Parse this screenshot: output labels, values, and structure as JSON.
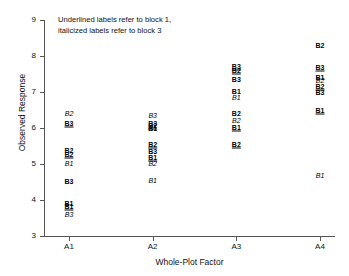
{
  "chart_data": {
    "type": "scatter",
    "title": "",
    "xlabel": "Whole-Plot Factor",
    "ylabel": "Observed Response",
    "annotation_line1": "Underlined labels refer to block 1,",
    "annotation_line2": "italicized labels refer to block 3",
    "grid": false,
    "legend": "none",
    "ylim": [
      3,
      9
    ],
    "yticks": [
      3,
      4,
      5,
      6,
      7,
      8,
      9
    ],
    "ytick_labels": [
      "3",
      "4",
      "5",
      "6",
      "7",
      "8",
      "9"
    ],
    "categories": [
      "A1",
      "A2",
      "A3",
      "A4"
    ],
    "xtick_labels": [
      "A1",
      "A2",
      "A3",
      "A4"
    ],
    "blocks": {
      "block1": "underlined",
      "block2": "bold",
      "block3": "italic"
    },
    "points": [
      {
        "x": "A1",
        "y": 6.42,
        "label": "B2",
        "block": 3
      },
      {
        "x": "A1",
        "y": 6.15,
        "label": "B3",
        "block": 1
      },
      {
        "x": "A1",
        "y": 5.38,
        "label": "B2",
        "block": 2
      },
      {
        "x": "A1",
        "y": 5.27,
        "label": "B2",
        "block": 1
      },
      {
        "x": "A1",
        "y": 5.02,
        "label": "B1",
        "block": 3
      },
      {
        "x": "A1",
        "y": 4.52,
        "label": "B3",
        "block": 2
      },
      {
        "x": "A1",
        "y": 3.93,
        "label": "B1",
        "block": 2
      },
      {
        "x": "A1",
        "y": 3.83,
        "label": "B1",
        "block": 1
      },
      {
        "x": "A1",
        "y": 3.6,
        "label": "B3",
        "block": 3
      },
      {
        "x": "A2",
        "y": 6.36,
        "label": "B3",
        "block": 3
      },
      {
        "x": "A2",
        "y": 6.14,
        "label": "B3",
        "block": 2
      },
      {
        "x": "A2",
        "y": 6.08,
        "label": "B2",
        "block": 1
      },
      {
        "x": "A2",
        "y": 5.99,
        "label": "B1",
        "block": 2
      },
      {
        "x": "A2",
        "y": 5.56,
        "label": "B2",
        "block": 1
      },
      {
        "x": "A2",
        "y": 5.36,
        "label": "B3",
        "block": 2
      },
      {
        "x": "A2",
        "y": 5.19,
        "label": "B1",
        "block": 1
      },
      {
        "x": "A2",
        "y": 5.04,
        "label": "B2",
        "block": 3
      },
      {
        "x": "A2",
        "y": 4.56,
        "label": "B1",
        "block": 3
      },
      {
        "x": "A3",
        "y": 7.71,
        "label": "B3",
        "block": 1
      },
      {
        "x": "A3",
        "y": 7.6,
        "label": "B2",
        "block": 1
      },
      {
        "x": "A3",
        "y": 7.36,
        "label": "B3",
        "block": 2
      },
      {
        "x": "A3",
        "y": 7.02,
        "label": "B1",
        "block": 2
      },
      {
        "x": "A3",
        "y": 6.85,
        "label": "B1",
        "block": 3
      },
      {
        "x": "A3",
        "y": 6.42,
        "label": "B2",
        "block": 2
      },
      {
        "x": "A3",
        "y": 6.21,
        "label": "B2",
        "block": 3
      },
      {
        "x": "A3",
        "y": 6.02,
        "label": "B1",
        "block": 1
      },
      {
        "x": "A3",
        "y": 5.56,
        "label": "B2",
        "block": 1
      },
      {
        "x": "A4",
        "y": 8.3,
        "label": "B2",
        "block": 2
      },
      {
        "x": "A4",
        "y": 7.69,
        "label": "B3",
        "block": 1
      },
      {
        "x": "A4",
        "y": 7.41,
        "label": "B1",
        "block": 2
      },
      {
        "x": "A4",
        "y": 7.34,
        "label": "B2",
        "block": 3
      },
      {
        "x": "A4",
        "y": 7.18,
        "label": "B2",
        "block": 1
      },
      {
        "x": "A4",
        "y": 6.99,
        "label": "B3",
        "block": 2
      },
      {
        "x": "A4",
        "y": 6.5,
        "label": "B1",
        "block": 1
      },
      {
        "x": "A4",
        "y": 4.7,
        "label": "B1",
        "block": 3
      }
    ]
  }
}
